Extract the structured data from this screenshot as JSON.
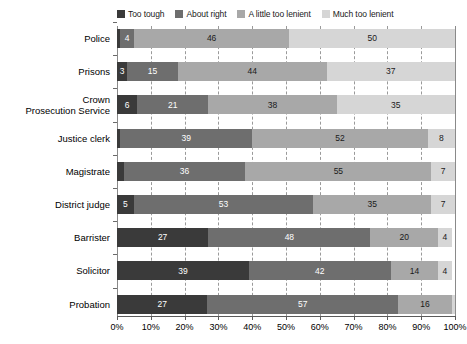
{
  "chart_data": {
    "type": "bar",
    "subtype": "horizontal-stacked-100",
    "title": "",
    "subtitle": "",
    "xlabel": "",
    "ylabel": "",
    "xlim": [
      0,
      100
    ],
    "xtick_labels": [
      "0%",
      "10%",
      "20%",
      "30%",
      "40%",
      "50%",
      "60%",
      "70%",
      "80%",
      "90%",
      "100%"
    ],
    "xticks": [
      0,
      10,
      20,
      30,
      40,
      50,
      60,
      70,
      80,
      90,
      100
    ],
    "grid": "vertical-dashed",
    "legend_position": "top",
    "categories": [
      "Police",
      "Prisons",
      "Crown\nProsecution Service",
      "Justice clerk",
      "Magistrate",
      "District judge",
      "Barrister",
      "Solicitor",
      "Probation"
    ],
    "series": [
      {
        "name": "Too tough",
        "color": "#3a3a3a",
        "values": [
          1,
          3,
          6,
          1,
          2,
          5,
          27,
          39,
          27
        ],
        "labels": [
          "",
          "3",
          "6",
          "1",
          "2",
          "5",
          "27",
          "39",
          "27"
        ]
      },
      {
        "name": "About right",
        "color": "#6e6e6e",
        "values": [
          4,
          15,
          21,
          39,
          36,
          53,
          48,
          42,
          57
        ],
        "labels": [
          "4",
          "15",
          "21",
          "39",
          "36",
          "53",
          "48",
          "42",
          "57"
        ]
      },
      {
        "name": "A little too lenient",
        "color": "#a8a8a8",
        "values": [
          46,
          44,
          38,
          52,
          55,
          35,
          20,
          14,
          16
        ],
        "labels": [
          "46",
          "44",
          "38",
          "52",
          "55",
          "35",
          "20",
          "14",
          "16"
        ]
      },
      {
        "name": "Much too lenient",
        "color": "#d6d6d6",
        "values": [
          49,
          38,
          35,
          8,
          7,
          7,
          4,
          4,
          1
        ],
        "labels": [
          "50",
          "37",
          "35",
          "8",
          "7",
          "7",
          "4",
          "4",
          "1"
        ]
      }
    ]
  },
  "legend": {
    "items": [
      {
        "label": "Too tough",
        "color": "#3a3a3a"
      },
      {
        "label": "About right",
        "color": "#6e6e6e"
      },
      {
        "label": "A little too lenient",
        "color": "#a8a8a8"
      },
      {
        "label": "Much too lenient",
        "color": "#d6d6d6"
      }
    ]
  }
}
